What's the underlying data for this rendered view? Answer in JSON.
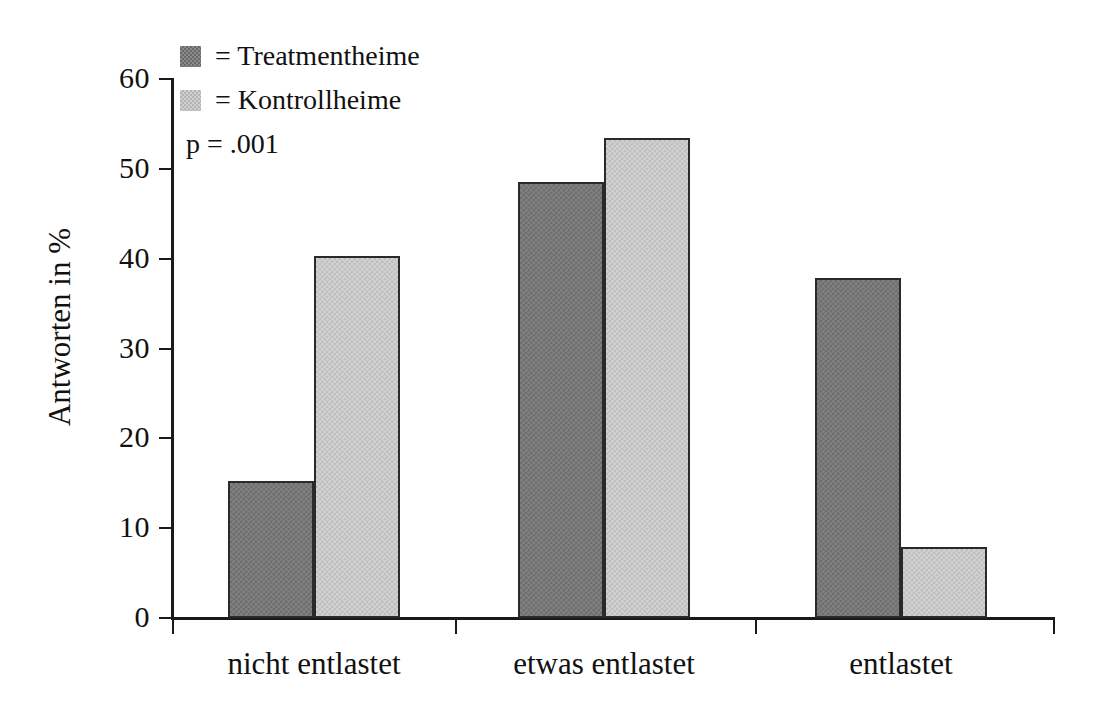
{
  "chart_data": {
    "type": "bar",
    "title": "",
    "xlabel": "",
    "ylabel": "Antworten in %",
    "ylim": [
      0,
      60
    ],
    "yticks": [
      0,
      10,
      20,
      30,
      40,
      50,
      60
    ],
    "ytick_labels": [
      "0",
      "10",
      "20",
      "30",
      "40",
      "50",
      "60"
    ],
    "grid": false,
    "legend_position": "top-left",
    "categories": [
      "nicht entlastet",
      "etwas entlastet",
      "entlastet"
    ],
    "series": [
      {
        "name": "Treatmentheime",
        "color": "#808080",
        "values": [
          15.1,
          48.4,
          37.7
        ]
      },
      {
        "name": "Kontrollheime",
        "color": "#d2d2d2",
        "values": [
          40.2,
          53.3,
          7.8
        ]
      }
    ],
    "annotations": [
      {
        "name": "p-value",
        "text": "p = .001"
      }
    ]
  },
  "legend": {
    "items": [
      {
        "swatch": "dark-hatch-swatch",
        "label": "=  Treatmentheime"
      },
      {
        "swatch": "light-hatch-swatch",
        "label": "=  Kontrollheime"
      }
    ],
    "note": "p = .001"
  },
  "axes": {
    "y_title": "Antworten in %"
  }
}
